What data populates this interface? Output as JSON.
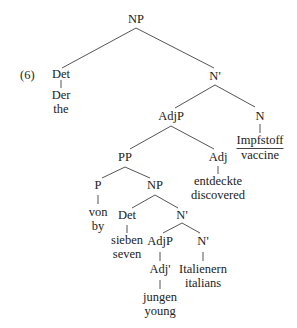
{
  "example_number": "(6)",
  "tree": {
    "root": "NP",
    "det_top": {
      "label": "Det",
      "word": "Der",
      "gloss": "the"
    },
    "nbar_top": "N'",
    "adjp_top": "AdjP",
    "n_head": {
      "label": "N",
      "word": "Impfstoff",
      "gloss": "vaccine"
    },
    "pp": "PP",
    "adj_top": {
      "label": "Adj",
      "word": "entdeckte",
      "gloss": "discovered"
    },
    "p": {
      "label": "P",
      "word": "von",
      "gloss": "by"
    },
    "np_inner": "NP",
    "det_inner": {
      "label": "Det",
      "word": "sieben",
      "gloss": "seven"
    },
    "nbar_inner": "N'",
    "adjp_inner": "AdjP",
    "adjbar": {
      "label": "Adj'",
      "word": "jungen",
      "gloss": "young"
    },
    "nbar_low": {
      "label": "N'",
      "word": "Italienern",
      "gloss": "italians"
    }
  },
  "colors": {
    "lines": "#555555",
    "text": "#222222",
    "background": "#ffffff"
  }
}
